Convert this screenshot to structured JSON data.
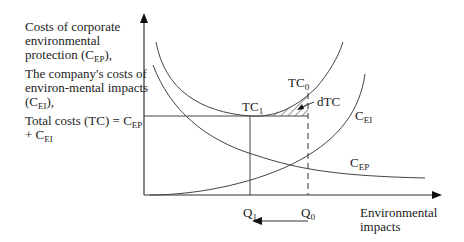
{
  "diagram": {
    "y_axis_label": {
      "line1_prefix": "Costs of corporate environmental protection (C",
      "line1_sub": "EP",
      "line1_suffix": "),",
      "line2_prefix": "The company's costs of environ-mental impacts (C",
      "line2_sub": "EI",
      "line2_suffix": "),",
      "line3_prefix": "Total costs (TC) = C",
      "line3_sub1": "EP",
      "line3_mid": " + C",
      "line3_sub2": "EI"
    },
    "x_axis_label_line1": "Environmental",
    "x_axis_label_line2": "impacts",
    "curves": {
      "tc": {
        "label": "TC",
        "sub0": "0",
        "sub1": "1"
      },
      "cei": {
        "label": "C",
        "sub": "EI"
      },
      "cep": {
        "label": "C",
        "sub": "EP"
      }
    },
    "points": {
      "q1": {
        "label": "Q",
        "sub": "1"
      },
      "q0": {
        "label": "Q",
        "sub": "0"
      }
    },
    "annotation": "dTC",
    "arrow_direction": "from Q0 to Q1 (leftward)"
  }
}
